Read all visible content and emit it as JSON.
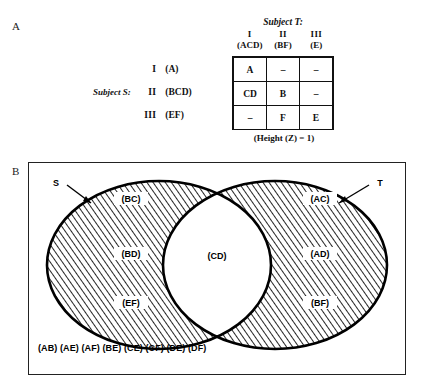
{
  "figure": {
    "panel_a_label": "A",
    "panel_b_label": "B"
  },
  "panel_a": {
    "subject_t_title": "Subject T:",
    "subject_s_title": "Subject S:",
    "column_headers": [
      {
        "roman": "I",
        "set": "(ACD)"
      },
      {
        "roman": "II",
        "set": "(BF)"
      },
      {
        "roman": "III",
        "set": "(E)"
      }
    ],
    "row_headers": [
      {
        "roman": "I",
        "set": "(A)"
      },
      {
        "roman": "II",
        "set": "(BCD)"
      },
      {
        "roman": "III",
        "set": "(EF)"
      }
    ],
    "matrix": [
      [
        "A",
        "–",
        "–"
      ],
      [
        "CD",
        "B",
        "–"
      ],
      [
        "–",
        "F",
        "E"
      ]
    ],
    "caption": "(Height (Z) = 1)"
  },
  "panel_b": {
    "left_set_label": "S",
    "right_set_label": "T",
    "left_only_labels": [
      "(BC)",
      "(BD)",
      "(EF)"
    ],
    "intersection_labels": [
      "(CD)"
    ],
    "right_only_labels": [
      "(AC)",
      "(AD)",
      "(BF)"
    ],
    "outside_labels": "(AB) (AE) (AF) (BE) (CE) (CF) (DE) (DF)"
  },
  "colors": {
    "ink": "#111111",
    "hatch": "#000000",
    "paper": "#ffffff"
  }
}
